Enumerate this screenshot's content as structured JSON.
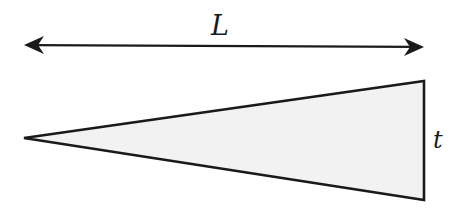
{
  "diagram": {
    "labels": {
      "length": "L",
      "thickness": "t"
    },
    "colors": {
      "stroke": "#1a1a1a",
      "fill": "#f2f2f2",
      "background": "#ffffff"
    },
    "shapes": {
      "dimension_arrow": {
        "x1": 24,
        "y1": 45,
        "x2": 424,
        "y2": 47,
        "double_headed": true
      },
      "wedge": {
        "apex": [
          24,
          138
        ],
        "top_right": [
          424,
          81
        ],
        "bottom_right": [
          424,
          200
        ]
      }
    }
  }
}
